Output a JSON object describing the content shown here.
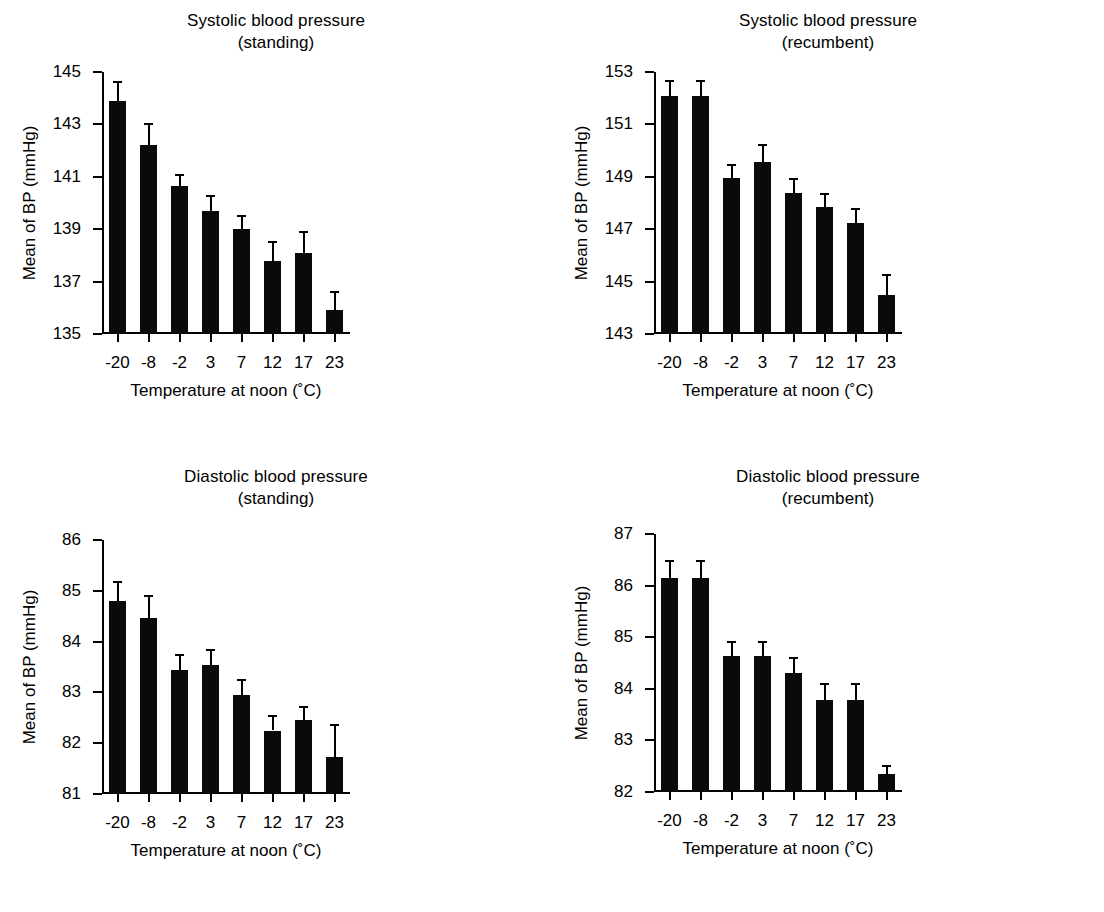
{
  "figure": {
    "background": "#ffffff",
    "ink_color": "#000000",
    "panel_count": 4
  },
  "chart_data": [
    {
      "id": "systolic-standing",
      "type": "bar",
      "title": "Systolic blood pressure",
      "subtitle": "(standing)",
      "title_lines": [
        "Systolic blood pressure",
        "(standing)"
      ],
      "xlabel": "Temperature at noon (˚C)",
      "ylabel": "Mean of BP (mmHg)",
      "categories": [
        "-20",
        "-8",
        "-2",
        "3",
        "7",
        "12",
        "17",
        "23"
      ],
      "values": [
        143.9,
        142.2,
        140.65,
        139.7,
        139.0,
        137.8,
        138.1,
        135.9
      ],
      "errors": [
        0.75,
        0.85,
        0.45,
        0.6,
        0.55,
        0.75,
        0.85,
        0.75
      ],
      "ylim": [
        135,
        145
      ],
      "yticks": [
        135,
        137,
        139,
        141,
        143,
        145
      ],
      "ytick_labels": [
        "135",
        "137",
        "139",
        "141",
        "143",
        "145"
      ],
      "grid": false,
      "legend": "none",
      "error_type": "sem"
    },
    {
      "id": "systolic-recumbent",
      "type": "bar",
      "title": "Systolic blood pressure",
      "subtitle": "(recumbent)",
      "title_lines": [
        "Systolic blood pressure",
        "(recumbent)"
      ],
      "xlabel": "Temperature at noon (˚C)",
      "ylabel": "Mean of BP (mmHg)",
      "categories": [
        "-20",
        "-8",
        "-2",
        "3",
        "7",
        "12",
        "17",
        "23"
      ],
      "values": [
        152.1,
        152.1,
        148.95,
        149.55,
        148.4,
        147.85,
        147.25,
        144.5
      ],
      "errors": [
        0.6,
        0.6,
        0.55,
        0.7,
        0.55,
        0.55,
        0.55,
        0.8
      ],
      "ylim": [
        143,
        153
      ],
      "yticks": [
        143,
        145,
        147,
        149,
        151,
        153
      ],
      "ytick_labels": [
        "143",
        "145",
        "147",
        "149",
        "151",
        "153"
      ],
      "grid": false,
      "legend": "none",
      "error_type": "sem"
    },
    {
      "id": "diastolic-standing",
      "type": "bar",
      "title": "Diastolic blood pressure",
      "subtitle": "(standing)",
      "title_lines": [
        "Diastolic blood pressure",
        "(standing)"
      ],
      "xlabel": "Temperature at noon (˚C)",
      "ylabel": "Mean of BP (mmHg)",
      "categories": [
        "-20",
        "-8",
        "-2",
        "3",
        "7",
        "12",
        "17",
        "23"
      ],
      "values": [
        84.8,
        84.47,
        83.45,
        83.54,
        82.94,
        82.25,
        82.45,
        81.72
      ],
      "errors": [
        0.4,
        0.45,
        0.3,
        0.32,
        0.33,
        0.3,
        0.28,
        0.65
      ],
      "ylim": [
        81,
        86
      ],
      "yticks": [
        81,
        82,
        83,
        84,
        85,
        86
      ],
      "ytick_labels": [
        "81",
        "82",
        "83",
        "84",
        "85",
        "86"
      ],
      "grid": false,
      "legend": "none",
      "error_type": "sem"
    },
    {
      "id": "diastolic-recumbent",
      "type": "bar",
      "title": "Diastolic blood pressure",
      "subtitle": "(recumbent)",
      "title_lines": [
        "Diastolic blood pressure",
        "(recumbent)"
      ],
      "xlabel": "Temperature at noon (˚C)",
      "ylabel": "Mean of BP (mmHg)",
      "categories": [
        "-20",
        "-8",
        "-2",
        "3",
        "7",
        "12",
        "17",
        "23"
      ],
      "values": [
        86.15,
        86.15,
        84.63,
        84.63,
        84.3,
        83.79,
        83.79,
        82.35
      ],
      "errors": [
        0.35,
        0.35,
        0.3,
        0.3,
        0.32,
        0.33,
        0.33,
        0.18
      ],
      "ylim": [
        82,
        87
      ],
      "yticks": [
        82,
        83,
        84,
        85,
        86,
        87
      ],
      "ytick_labels": [
        "82",
        "83",
        "84",
        "85",
        "86",
        "87"
      ],
      "grid": false,
      "legend": "none",
      "error_type": "sem"
    }
  ]
}
